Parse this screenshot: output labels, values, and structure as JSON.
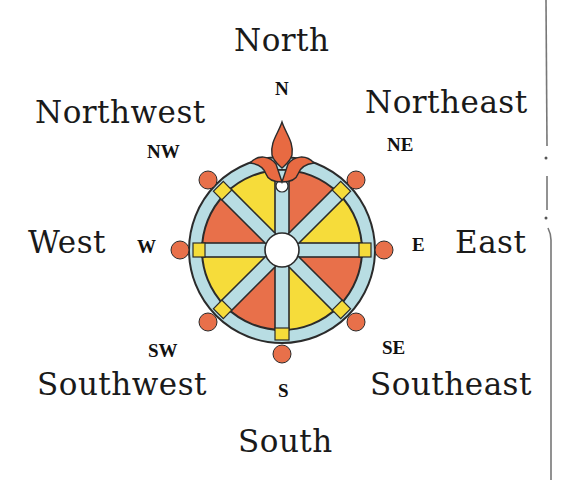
{
  "diagram": {
    "directions": [
      {
        "abbr": "N",
        "name": "North"
      },
      {
        "abbr": "NE",
        "name": "Northeast"
      },
      {
        "abbr": "E",
        "name": "East"
      },
      {
        "abbr": "SE",
        "name": "Southeast"
      },
      {
        "abbr": "S",
        "name": "South"
      },
      {
        "abbr": "SW",
        "name": "Southwest"
      },
      {
        "abbr": "W",
        "name": "West"
      },
      {
        "abbr": "NW",
        "name": "Northwest"
      }
    ],
    "colors": {
      "segment_orange": "#e8704a",
      "segment_yellow": "#f6dc3a",
      "ring_blue": "#b8dde3",
      "outline": "#2b2b2b",
      "fleur_orange": "#e86a42"
    }
  }
}
